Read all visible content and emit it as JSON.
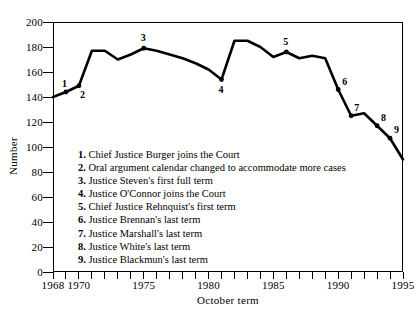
{
  "chart_data": {
    "type": "line",
    "title": "",
    "xlabel": "October term",
    "ylabel": "Number",
    "xlim": [
      1968,
      1995
    ],
    "ylim": [
      0,
      200
    ],
    "grid": false,
    "legend_position": "inside-lower-left",
    "x": [
      1968,
      1969,
      1970,
      1971,
      1972,
      1973,
      1974,
      1975,
      1976,
      1977,
      1978,
      1979,
      1980,
      1981,
      1982,
      1983,
      1984,
      1985,
      1986,
      1987,
      1988,
      1989,
      1990,
      1991,
      1992,
      1993,
      1994,
      1995
    ],
    "values": [
      140,
      144,
      149,
      177,
      177,
      170,
      174,
      179,
      177,
      174,
      171,
      167,
      162,
      154,
      185,
      185,
      180,
      172,
      176,
      171,
      173,
      171,
      146,
      125,
      127,
      117,
      107,
      90
    ],
    "series": [
      {
        "name": "Cases",
        "values": [
          140,
          144,
          149,
          177,
          177,
          170,
          174,
          179,
          177,
          174,
          171,
          167,
          162,
          154,
          185,
          185,
          180,
          172,
          176,
          171,
          173,
          171,
          146,
          125,
          127,
          117,
          107,
          90
        ]
      }
    ],
    "x_ticks_labeled": [
      "1968",
      "1970",
      "1975",
      "1980",
      "1985",
      "1990",
      "1995"
    ],
    "x_ticks_labeled_values": [
      1968,
      1970,
      1975,
      1980,
      1985,
      1990,
      1995
    ],
    "y_ticks": [
      0,
      20,
      40,
      60,
      80,
      100,
      120,
      140,
      160,
      180,
      200
    ],
    "annotations": [
      {
        "id": "1",
        "year": 1969,
        "value": 144,
        "label_dx": -4,
        "label_dy": -13
      },
      {
        "id": "2",
        "year": 1970,
        "value": 149,
        "label_dx": 1,
        "label_dy": 4
      },
      {
        "id": "3",
        "year": 1975,
        "value": 179,
        "label_dx": -3,
        "label_dy": -15
      },
      {
        "id": "4",
        "year": 1981,
        "value": 154,
        "label_dx": -3,
        "label_dy": 5
      },
      {
        "id": "5",
        "year": 1986,
        "value": 176,
        "label_dx": -3,
        "label_dy": -15
      },
      {
        "id": "6",
        "year": 1990,
        "value": 146,
        "label_dx": 4,
        "label_dy": -13
      },
      {
        "id": "7",
        "year": 1991,
        "value": 125,
        "label_dx": 3,
        "label_dy": -13
      },
      {
        "id": "8",
        "year": 1993,
        "value": 117,
        "label_dx": 4,
        "label_dy": -13
      },
      {
        "id": "9",
        "year": 1994,
        "value": 107,
        "label_dx": 4,
        "label_dy": -13
      }
    ],
    "line_color": "#000000",
    "line_width": 2.6,
    "marker_color": "#000000"
  },
  "legend": {
    "items": [
      {
        "num": "1.",
        "text": "Chief Justice Burger joins the Court"
      },
      {
        "num": "2.",
        "text": "Oral argument calendar changed to accommodate more cases"
      },
      {
        "num": "3.",
        "text": "Justice Steven's first full term"
      },
      {
        "num": "4.",
        "text": "Justice O'Connor joins the Court"
      },
      {
        "num": "5.",
        "text": "Chief Justice Rehnquist's first term"
      },
      {
        "num": "6.",
        "text": "Justice Brennan's last term"
      },
      {
        "num": "7.",
        "text": "Justice Marshall's last term"
      },
      {
        "num": "8.",
        "text": "Justice White's last term"
      },
      {
        "num": "9.",
        "text": "Justice Blackmun's last term"
      }
    ]
  }
}
